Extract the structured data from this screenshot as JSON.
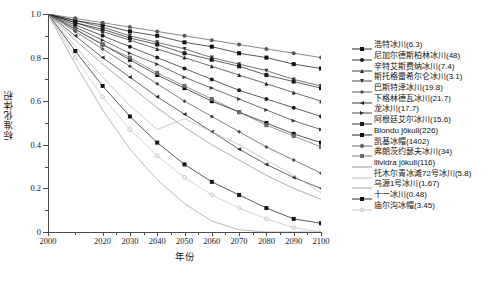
{
  "chart_data": {
    "type": "line",
    "title": "",
    "xlabel": "年份",
    "ylabel": "标准化体积",
    "xlim": [
      2000,
      2100
    ],
    "ylim": [
      0,
      1.0
    ],
    "xticks": [
      2000,
      2020,
      2030,
      2040,
      2050,
      2060,
      2070,
      2080,
      2090,
      2100
    ],
    "xtick_labels": [
      "2000",
      "2020",
      "2030",
      "2040",
      "2050",
      "2060",
      "2070",
      "2080",
      "2090",
      "2100"
    ],
    "x_minor_ticks": [
      2010,
      2025,
      2035,
      2045,
      2055,
      2065,
      2075,
      2085,
      2095
    ],
    "yticks": [
      0,
      0.2,
      0.4,
      0.6,
      0.8,
      1.0
    ],
    "ytick_labels": [
      "0",
      "0.2",
      "0.4",
      "0.6",
      "0.8",
      "1.0"
    ],
    "y_minor_ticks": [
      0.1,
      0.3,
      0.5,
      0.7,
      0.9
    ],
    "grid": false,
    "legend_position": "right",
    "x": [
      2000,
      2010,
      2020,
      2030,
      2040,
      2050,
      2060,
      2070,
      2080,
      2090,
      2100
    ],
    "series": [
      {
        "name": "浩特冰川(6.3)",
        "area": 6.3,
        "color": "#111111",
        "marker": "square",
        "values": [
          1.0,
          0.93,
          0.86,
          0.79,
          0.72,
          0.66,
          0.6,
          0.55,
          0.5,
          0.45,
          0.41
        ]
      },
      {
        "name": "尼加尔德斯柏林冰川(48)",
        "area": 48,
        "color": "#1d1d1d",
        "marker": "circle",
        "values": [
          1.0,
          0.95,
          0.9,
          0.85,
          0.8,
          0.75,
          0.7,
          0.65,
          0.61,
          0.57,
          0.53
        ]
      },
      {
        "name": "辛特艾斯费纳冰川(7.4)",
        "area": 7.4,
        "color": "#2a2a2a",
        "marker": "triangle-up",
        "values": [
          1.0,
          0.96,
          0.92,
          0.88,
          0.84,
          0.8,
          0.76,
          0.72,
          0.68,
          0.64,
          0.6
        ]
      },
      {
        "name": "斯托格雷希尔仑冰川(3.1)",
        "area": 3.1,
        "color": "#3a3a3a",
        "marker": "triangle-down",
        "values": [
          1.0,
          0.97,
          0.94,
          0.9,
          0.87,
          0.84,
          0.8,
          0.77,
          0.74,
          0.7,
          0.67
        ]
      },
      {
        "name": "巴斯特泽冰川(19.8)",
        "area": 19.8,
        "color": "#4a4a4a",
        "marker": "diamond",
        "values": [
          1.0,
          0.92,
          0.84,
          0.76,
          0.68,
          0.6,
          0.53,
          0.46,
          0.39,
          0.33,
          0.27
        ]
      },
      {
        "name": "下格林德瓦冰川(21.7)",
        "area": 21.7,
        "color": "#262626",
        "marker": "triangle-left",
        "values": [
          1.0,
          0.9,
          0.8,
          0.71,
          0.62,
          0.54,
          0.46,
          0.38,
          0.31,
          0.25,
          0.2
        ]
      },
      {
        "name": "龙冰川(17.7)",
        "area": 17.7,
        "color": "#333333",
        "marker": "triangle-right",
        "values": [
          1.0,
          0.94,
          0.88,
          0.82,
          0.77,
          0.71,
          0.66,
          0.61,
          0.56,
          0.51,
          0.47
        ]
      },
      {
        "name": "阿根廷艾尔冰川(15.6)",
        "area": 15.6,
        "color": "#1a1a1a",
        "marker": "square",
        "values": [
          1.0,
          0.96,
          0.93,
          0.89,
          0.86,
          0.82,
          0.79,
          0.76,
          0.72,
          0.69,
          0.66
        ]
      },
      {
        "name": "Blondu jökull(226)",
        "area": 226,
        "color": "#0d0d0d",
        "marker": "square",
        "values": [
          1.0,
          0.97,
          0.95,
          0.92,
          0.9,
          0.87,
          0.85,
          0.82,
          0.8,
          0.77,
          0.75
        ]
      },
      {
        "name": "凯基冰帽(1402)",
        "area": 1402,
        "color": "#585858",
        "marker": "circle",
        "values": [
          1.0,
          0.98,
          0.96,
          0.94,
          0.92,
          0.9,
          0.88,
          0.86,
          0.84,
          0.82,
          0.8
        ]
      },
      {
        "name": "弗朗茨约瑟夫冰川(34)",
        "area": 34,
        "color": "#6a6a6a",
        "marker": "square",
        "values": [
          1.0,
          0.93,
          0.86,
          0.8,
          0.73,
          0.67,
          0.61,
          0.55,
          0.49,
          0.44,
          0.39
        ]
      },
      {
        "name": "lllvidra jökull(116)",
        "area": 116,
        "color": "#888888",
        "marker": "none",
        "values": [
          1.0,
          0.88,
          0.77,
          0.67,
          0.57,
          0.48,
          0.4,
          0.33,
          0.26,
          0.2,
          0.15
        ]
      },
      {
        "name": "托木尔青冰滩72号冰川(5.8)",
        "area": 5.8,
        "color": "#b5b5b5",
        "marker": "none",
        "values": [
          1.0,
          0.85,
          0.71,
          0.58,
          0.47,
          0.52,
          0.46,
          0.4,
          0.33,
          0.26,
          0.18
        ]
      },
      {
        "name": "乌源1号冰川(1.67)",
        "area": 1.67,
        "color": "#9a9a9a",
        "marker": "none",
        "values": [
          1.0,
          0.77,
          0.56,
          0.38,
          0.24,
          0.13,
          0.05,
          0.01,
          0.0,
          0.0,
          0.0
        ]
      },
      {
        "name": "十一冰川(0.48)",
        "area": 0.48,
        "color": "#141414",
        "marker": "square",
        "values": [
          1.0,
          0.83,
          0.67,
          0.53,
          0.41,
          0.31,
          0.23,
          0.17,
          0.11,
          0.06,
          0.04
        ]
      },
      {
        "name": "庙尔沟冰帽(3.45)",
        "area": 3.45,
        "color": "#c2c2c2",
        "marker": "circle-open",
        "values": [
          1.0,
          0.8,
          0.62,
          0.47,
          0.35,
          0.25,
          0.17,
          0.11,
          0.06,
          0.02,
          0.0
        ]
      }
    ]
  },
  "caption": ""
}
